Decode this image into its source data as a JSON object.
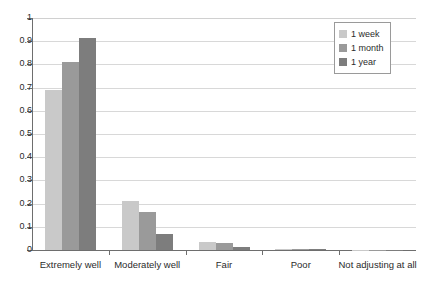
{
  "chart_data": {
    "type": "bar",
    "title": "",
    "subtitle": "",
    "xlabel": "",
    "ylabel": "",
    "ylim": [
      0,
      1
    ],
    "ytick_labels": [
      "1",
      "0.9",
      "0.8",
      "0.7",
      "0.6",
      "0.5",
      "0.4",
      "0.3",
      "0.2",
      "0.1",
      "0"
    ],
    "ytick_values": [
      1,
      0.9,
      0.8,
      0.7,
      0.6,
      0.5,
      0.4,
      0.3,
      0.2,
      0.1,
      0
    ],
    "grid": "horizontal",
    "legend_position": "top-right",
    "categories": [
      "Extremely well",
      "Moderately well",
      "Fair",
      "Poor",
      "Not adjusting at all"
    ],
    "series": [
      {
        "name": "1 week",
        "color": "#c9c9c9",
        "values": [
          0.69,
          0.21,
          0.035,
          0.006,
          0.002
        ]
      },
      {
        "name": "1 month",
        "color": "#9a9a9a",
        "values": [
          0.81,
          0.165,
          0.03,
          0.004,
          0.001
        ]
      },
      {
        "name": "1 year",
        "color": "#7d7d7d",
        "values": [
          0.915,
          0.07,
          0.012,
          0.003,
          0.001
        ]
      }
    ]
  },
  "legend": {
    "items": [
      {
        "label": "1 week"
      },
      {
        "label": "1 month"
      },
      {
        "label": "1 year"
      }
    ]
  },
  "axes": {
    "y": {
      "labels": [
        "1",
        "0.9",
        "0.8",
        "0.7",
        "0.6",
        "0.5",
        "0.4",
        "0.3",
        "0.2",
        "0.1",
        "0"
      ]
    },
    "x": {
      "labels": [
        "Extremely well",
        "Moderately well",
        "Fair",
        "Poor",
        "Not adjusting at all"
      ]
    }
  },
  "colors": {
    "series_1": "#c9c9c9",
    "series_2": "#9a9a9a",
    "series_3": "#7d7d7d",
    "axis": "#6e6e6e",
    "grid": "#d8d8d8",
    "text": "#2b2b2b",
    "background": "#ffffff"
  }
}
